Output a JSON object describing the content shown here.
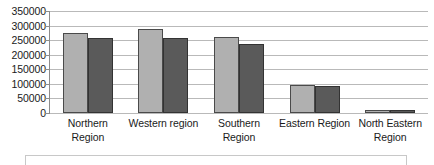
{
  "chart_data": {
    "type": "bar",
    "title": "",
    "xlabel": "",
    "ylabel": "",
    "categories": [
      "Northern Region",
      "Western region",
      "Southern Region",
      "Eastern Region",
      "North Eastern Region"
    ],
    "category_lines": [
      [
        "Northern",
        "Region"
      ],
      [
        "Western region",
        ""
      ],
      [
        "Southern",
        "Region"
      ],
      [
        "Eastern Region",
        ""
      ],
      [
        "North Eastern",
        "Region"
      ]
    ],
    "series": [
      {
        "name": "Series 1",
        "color": "#b0b0b0",
        "values": [
          275000,
          290000,
          260000,
          97000,
          11000
        ]
      },
      {
        "name": "Series 2",
        "color": "#5a5a5a",
        "values": [
          257000,
          257000,
          236000,
          93000,
          9000
        ]
      }
    ],
    "ylim": [
      0,
      350000
    ],
    "ytick_values": [
      0,
      50000,
      100000,
      150000,
      200000,
      250000,
      300000,
      350000
    ],
    "ytick_labels": [
      "0",
      "50000",
      "100000",
      "150000",
      "200000",
      "250000",
      "300000",
      "350000"
    ],
    "grid": true,
    "legend_position": "bottom"
  },
  "colors": {
    "series_a": "#b0b0b0",
    "series_b": "#5a5a5a",
    "gridline": "#b9b9b9",
    "axis": "#8c8c8c",
    "text": "#1a1a1a",
    "background": "#ffffff"
  }
}
